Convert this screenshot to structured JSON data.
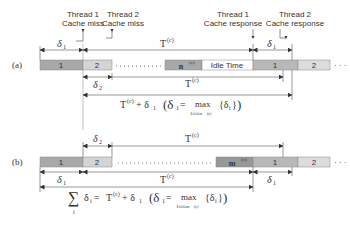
{
  "labels": {
    "row_a": "(a)",
    "row_b": "(b)",
    "t1_miss_l1": "Thread 1",
    "t1_miss_l2": "Cache miss",
    "t2_miss_l1": "Thread 2",
    "t2_miss_l2": "Cache miss",
    "t1_resp_l1": "Thread 1",
    "t1_resp_l2": "Cache response",
    "t2_resp_l1": "Thread 2",
    "t2_resp_l2": "Cache response"
  },
  "bars": {
    "one": "1",
    "two": "2",
    "idle": "Idle Time",
    "n": "n",
    "m": "m",
    "sup_c": "(c)",
    "ellipsis": "· · ·"
  },
  "symbols": {
    "delta": "δ",
    "sub1": "1",
    "sub2": "2",
    "T": "T",
    "sup_c": "(c)"
  },
  "formulas": {
    "a_main": "T",
    "a_rest": " + δ",
    "a_paren": "(δ",
    "eq": " = ",
    "max": "max",
    "a_under": "1≤i≤n",
    "b_under": "1≤i≤m",
    "brace": "{δ",
    "brace_close": "}",
    "paren_close": ")",
    "sum": "∑",
    "sum_i": "i",
    "sum_delta": "δ"
  },
  "colors": {
    "bar_dark": "#a8a8a8",
    "bar_light": "#d4d4d4",
    "line": "#555555"
  }
}
